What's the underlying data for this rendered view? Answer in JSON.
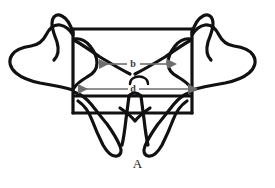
{
  "figure": {
    "panel_label": "A",
    "caption_position": "below",
    "background_color": "#ffffff",
    "outline_color": "#111111",
    "annotation_color": "#6e6e6e",
    "label_text_color": "#3a3a3a"
  },
  "subject": {
    "name": "vertebra-line-drawing",
    "view": "axial-superior",
    "description": "Outline drawing of a vertebra showing body, pedicles, transverse processes, laminae and spinous process"
  },
  "annotations": {
    "dimensions": [
      {
        "id": "b",
        "label": "b",
        "kind": "double-headed-arrow",
        "orientation": "horizontal",
        "x_start": 98,
        "x_end": 168,
        "y": 64,
        "label_x": 133,
        "label_y": 62,
        "color": "#6e6e6e"
      },
      {
        "id": "d",
        "label": "d",
        "kind": "double-headed-arrow",
        "orientation": "horizontal",
        "x_start": 77,
        "x_end": 189,
        "y": 89,
        "label_x": 133,
        "label_y": 89,
        "color": "#6e6e6e"
      }
    ],
    "canal_arc": {
      "name": "spinal-canal-arc",
      "center_x": 139,
      "center_y": 80,
      "radius": 9
    }
  },
  "geometry": {
    "body_rect": {
      "x": 73,
      "y": 29,
      "width": 119,
      "height": 84
    },
    "canvas": {
      "width": 275,
      "height": 188
    }
  }
}
